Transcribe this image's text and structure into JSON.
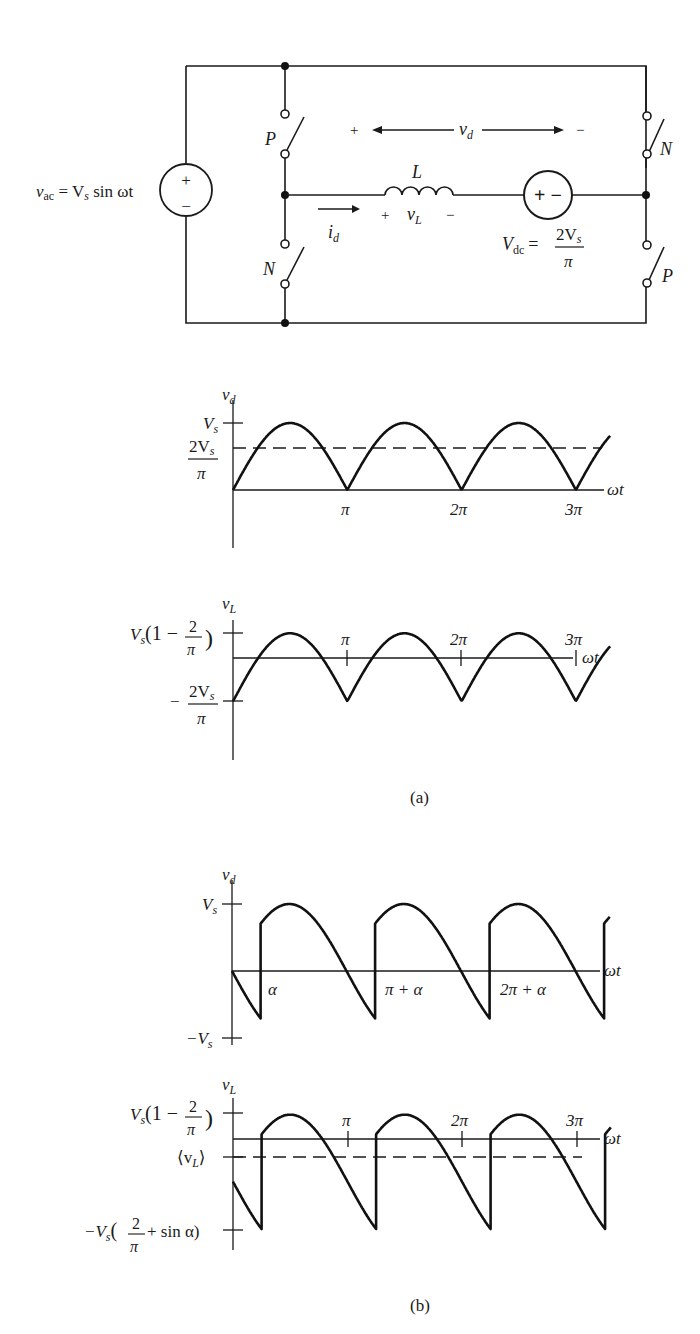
{
  "figure": {
    "captions": {
      "a": "(a)",
      "b": "(b)"
    }
  },
  "circuit": {
    "source_ac": {
      "label_lhs": "v",
      "label_sub": "ac",
      "label_rhs": " = V",
      "label_rhs_sub": "s",
      "label_tail": " sin ωt",
      "plus": "+",
      "minus": "−"
    },
    "switches": [
      {
        "id": "left-top",
        "label": "P"
      },
      {
        "id": "left-bottom",
        "label": "N"
      },
      {
        "id": "right-top",
        "label": "N"
      },
      {
        "id": "right-bottom",
        "label": "P"
      }
    ],
    "inductor": {
      "label": "L",
      "voltage_label": "v",
      "voltage_sub": "L",
      "plus": "+",
      "minus": "−"
    },
    "current": {
      "label": "i",
      "sub": "d"
    },
    "vd_arrow": {
      "label": "v",
      "sub": "d",
      "plus": "+",
      "minus": "−"
    },
    "source_dc": {
      "symbol": "+ −",
      "label": "V",
      "label_sub": "dc",
      "eq": "=",
      "num": "2V",
      "num_sub": "s",
      "den": "π"
    }
  },
  "chart_data": [
    {
      "id": "a-vd",
      "type": "line",
      "title": "",
      "ylabel": "v_d",
      "xlabel": "ωt",
      "description": "Rectified sine |Vs sin ωt| with dashed average 2Vs/π",
      "y_ticks": [
        {
          "label": "V_s",
          "value": 1.0
        },
        {
          "label": "2V_s/π",
          "value": 0.6366
        }
      ],
      "x_ticks": [
        "π",
        "2π",
        "3π"
      ],
      "series": [
        {
          "name": "v_d",
          "x_range": [
            0,
            3.3
          ],
          "formula": "|sin(x·π)|",
          "style": "solid"
        },
        {
          "name": "avg",
          "value": 0.6366,
          "style": "dashed"
        }
      ]
    },
    {
      "id": "a-vL",
      "type": "line",
      "ylabel": "v_L",
      "xlabel": "ωt",
      "description": "Inductor voltage |sin| − 2/π",
      "y_ticks": [
        {
          "label": "V_s(1 − 2/π)",
          "value": 0.3634
        },
        {
          "label": "−2V_s/π",
          "value": -0.6366
        }
      ],
      "x_ticks": [
        "π",
        "2π",
        "3π"
      ],
      "series": [
        {
          "name": "v_L",
          "x_range": [
            0,
            3.3
          ],
          "formula": "|sin(x·π)| − 2/π",
          "style": "solid"
        }
      ]
    },
    {
      "id": "b-vd",
      "type": "line",
      "ylabel": "v_d",
      "xlabel": "ωt",
      "description": "Delayed switching by α: v_d = sin(ωt) segments shifted, jumps at α, π+α, 2π+α",
      "y_ticks": [
        {
          "label": "V_s",
          "value": 1.0
        },
        {
          "label": "−V_s",
          "value": -1.0
        }
      ],
      "x_ticks": [
        "α",
        "π + α",
        "2π + α"
      ],
      "alpha_fraction": 0.25,
      "series": [
        {
          "name": "v_d",
          "x_range": [
            0,
            3.3
          ],
          "style": "solid"
        }
      ]
    },
    {
      "id": "b-vL",
      "type": "line",
      "ylabel": "v_L",
      "xlabel": "ωt",
      "description": "v_L = v_d − 2Vs/π with dashed average ⟨v_L⟩ below zero",
      "y_ticks": [
        {
          "label": "V_s(1 − 2/π)",
          "value": 0.3634
        },
        {
          "label": "⟨v_L⟩",
          "value": -0.23
        },
        {
          "label": "−V_s(2/π + sin α)",
          "value": -1.3437
        }
      ],
      "x_ticks": [
        "π",
        "2π",
        "3π"
      ],
      "alpha_fraction": 0.25,
      "series": [
        {
          "name": "v_L",
          "x_range": [
            0,
            3.3
          ],
          "style": "solid"
        },
        {
          "name": "avg",
          "label": "⟨v_L⟩",
          "style": "dashed"
        }
      ]
    }
  ],
  "plots": {
    "a_vd": {
      "ylabel": "v",
      "ylabel_sub": "d",
      "tick_vs": "V",
      "tick_vs_sub": "s",
      "tick_avg_num": "2V",
      "tick_avg_num_sub": "s",
      "tick_avg_den": "π",
      "xlabel": "ωt",
      "x1": "π",
      "x2": "2π",
      "x3": "3π"
    },
    "a_vl": {
      "ylabel": "v",
      "ylabel_sub": "L",
      "tick_top_a": "V",
      "tick_top_sub": "s",
      "tick_top_b": "(1 − ",
      "tick_top_num": "2",
      "tick_top_den": "π",
      "tick_top_c": ")",
      "tick_bot_minus": "−",
      "tick_bot_num": "2V",
      "tick_bot_num_sub": "s",
      "tick_bot_den": "π",
      "xlabel": "ωt",
      "x1": "π",
      "x2": "2π",
      "x3": "3π"
    },
    "b_vd": {
      "ylabel": "v",
      "ylabel_sub": "d",
      "tick_vs": "V",
      "tick_vs_sub": "s",
      "tick_neg": "−V",
      "tick_neg_sub": "s",
      "xlabel": "ωt",
      "x1": "α",
      "x2": "π + α",
      "x3": "2π + α"
    },
    "b_vl": {
      "ylabel": "v",
      "ylabel_sub": "L",
      "tick_top_a": "V",
      "tick_top_sub": "s",
      "tick_top_b": "(1 − ",
      "tick_top_num": "2",
      "tick_top_den": "π",
      "tick_top_c": ")",
      "tick_avg": "⟨v",
      "tick_avg_sub": "L",
      "tick_avg_end": "⟩",
      "tick_bot_a": "−V",
      "tick_bot_sub": "s",
      "tick_bot_b": "(",
      "tick_bot_num": "2",
      "tick_bot_den": "π",
      "tick_bot_c": " + sin α)",
      "xlabel": "ωt",
      "x1": "π",
      "x2": "2π",
      "x3": "3π"
    }
  }
}
